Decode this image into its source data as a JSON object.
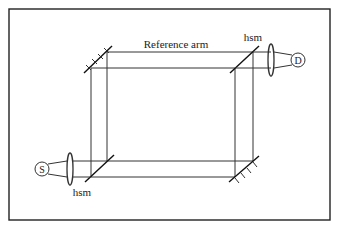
{
  "diagram": {
    "labels": {
      "reference_arm": "Reference arm",
      "hsm_top": "hsm",
      "hsm_bottom": "hsm",
      "source": "S",
      "detector": "D"
    },
    "components": [
      {
        "id": "source",
        "type": "circle",
        "label": "S"
      },
      {
        "id": "detector",
        "type": "circle",
        "label": "D"
      },
      {
        "id": "hsm-top-right",
        "type": "half-silvered mirror"
      },
      {
        "id": "hsm-bottom-left",
        "type": "half-silvered mirror"
      },
      {
        "id": "mirror-top-left",
        "type": "mirror"
      },
      {
        "id": "mirror-bottom-right",
        "type": "mirror"
      },
      {
        "id": "lens-left",
        "type": "lens"
      },
      {
        "id": "lens-right",
        "type": "lens"
      }
    ],
    "colors": {
      "line": "#333333",
      "background": "#ffffff"
    }
  }
}
